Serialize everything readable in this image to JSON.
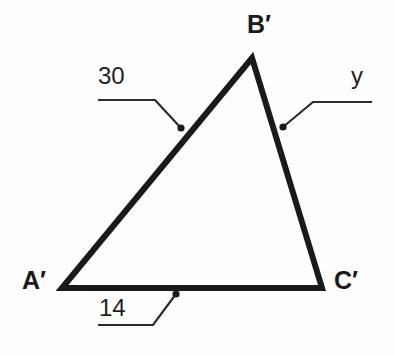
{
  "figure": {
    "type": "geometry-diagram",
    "shape": "triangle",
    "background_color": "#fefefe",
    "stroke_color": "#1a1a1a",
    "leader_color": "#2b2b2b",
    "triangle_stroke_width": 6,
    "leader_stroke_width": 2
  },
  "vertices": {
    "a": {
      "label": "A′",
      "x": 62,
      "y": 288
    },
    "b": {
      "label": "B′",
      "x": 252,
      "y": 58
    },
    "c": {
      "label": "C′",
      "x": 322,
      "y": 288
    }
  },
  "measurements": [
    {
      "id": "side-ab",
      "label": "30",
      "side": "A′B′",
      "anchor_x": 181,
      "anchor_y": 128
    },
    {
      "id": "side-bc",
      "label": "y",
      "side": "B′C′",
      "anchor_x": 283,
      "anchor_y": 127
    },
    {
      "id": "side-ac",
      "label": "14",
      "side": "A′C′",
      "anchor_x": 176,
      "anchor_y": 294
    }
  ],
  "leaders": {
    "leader_30": "M 98 100 L 155 100 L 181 128",
    "leader_y": "M 283 127 L 313 102 L 372 102",
    "leader_14": "M 98 325 L 153 325 L 176 294"
  },
  "paths": {
    "triangle": "M 62 288 L 252 58 L 322 288 Z"
  }
}
